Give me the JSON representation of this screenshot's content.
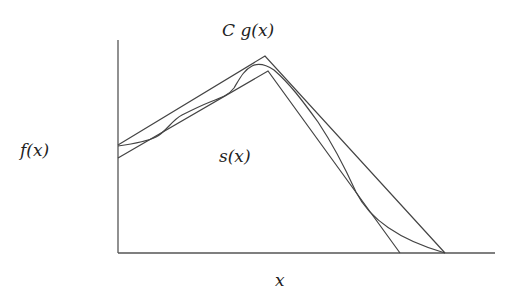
{
  "diagram": {
    "title": "",
    "labels": {
      "envelope": "C g(x)",
      "target": "f(x)",
      "squeeze": "s(x)",
      "x_axis": "x"
    },
    "colors": {
      "line": "#444444",
      "axis": "#555555",
      "text": "#222222",
      "background": "#ffffff"
    },
    "axes": {
      "origin": [
        118,
        253
      ],
      "y_top": 40,
      "x_end": 495
    },
    "curves": {
      "envelope_Cg": [
        [
          118,
          145
        ],
        [
          265,
          56
        ],
        [
          445,
          253
        ]
      ],
      "squeeze_s": [
        [
          118,
          158
        ],
        [
          268,
          71
        ],
        [
          400,
          253
        ]
      ],
      "target_f": "wavy curve from (118,146) bounded between s(x) and Cg(x), peaking near (258,64), ending at (445,253)"
    }
  }
}
